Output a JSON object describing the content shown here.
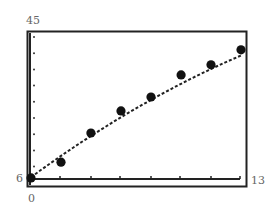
{
  "chart_data": {
    "type": "scatter",
    "title": "",
    "xlabel": "",
    "ylabel": "",
    "xlim": [
      0,
      13
    ],
    "ylim": [
      6,
      45
    ],
    "tick_labels": {
      "x_min": "0",
      "x_max": "13",
      "y_min": "6",
      "y_max": "45"
    },
    "grid": false,
    "legend": null,
    "series": [
      {
        "name": "data",
        "style": "filled-circle-markers",
        "x": [
          0,
          1.86,
          3.71,
          5.57,
          7.43,
          9.29,
          11.14,
          13
        ],
        "y": [
          6.3,
          10.5,
          18.3,
          24.2,
          27.9,
          33.8,
          36.5,
          40.5
        ]
      },
      {
        "name": "fit",
        "style": "dashed-curve",
        "x": [
          0,
          1,
          2,
          3,
          4,
          5,
          6,
          7,
          8,
          9,
          10,
          11,
          12,
          13
        ],
        "y": [
          6.5,
          9.6,
          12.6,
          15.5,
          18.3,
          21.0,
          23.6,
          26.1,
          28.5,
          30.8,
          33.0,
          35.1,
          37.1,
          39.0
        ]
      }
    ],
    "x_ticks_count": 13,
    "y_ticks_count": 13
  }
}
